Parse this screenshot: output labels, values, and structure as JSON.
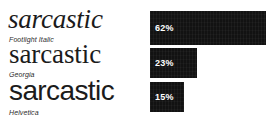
{
  "chart_data": {
    "type": "bar",
    "orientation": "horizontal",
    "title": "",
    "xlabel": "",
    "ylabel": "",
    "grid": false,
    "legend": null,
    "categories": [
      "Footlight Italic",
      "Georgia",
      "Helvetica"
    ],
    "values": [
      62,
      23,
      15
    ],
    "value_labels": [
      "62%",
      "23%",
      "15%"
    ],
    "xlim": [
      0,
      100
    ],
    "unit": "%",
    "bar_color": "#121212",
    "value_label_color": "#ffffff",
    "background_color": "#ffffff"
  },
  "figure": {
    "background_color": "#ffffff",
    "specimen_word": "sarcastic",
    "specimens": [
      {
        "word": "sarcastic",
        "caption": "Footlight Italic",
        "style": "serif-italic",
        "value_label": "62%",
        "value": 62
      },
      {
        "word": "sarcastic",
        "caption": "Georgia",
        "style": "serif-regular",
        "value_label": "23%",
        "value": 23
      },
      {
        "word": "sarcastic",
        "caption": "Helvetica",
        "style": "sans-regular",
        "value_label": "15%",
        "value": 15
      }
    ]
  }
}
